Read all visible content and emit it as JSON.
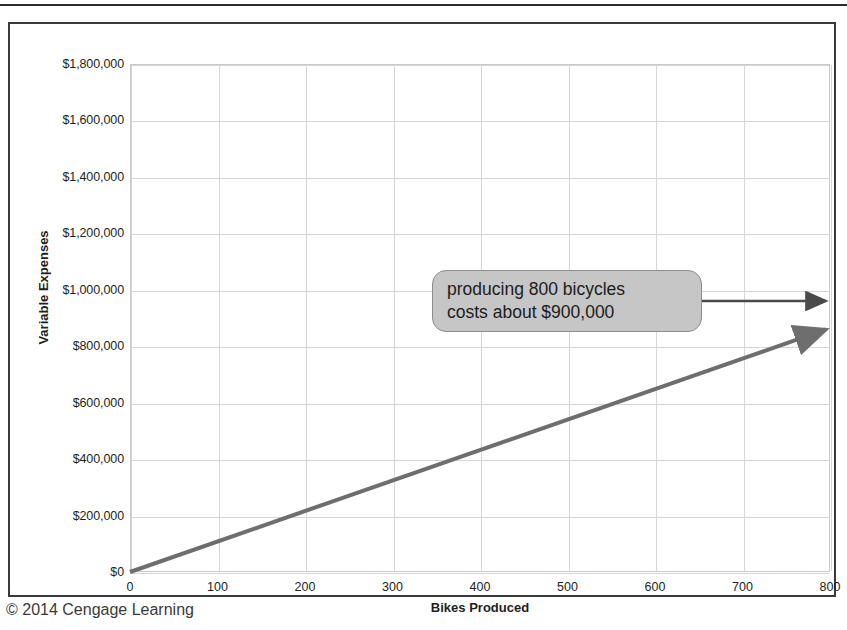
{
  "figure": {
    "credit": "© 2014 Cengage Learning"
  },
  "callout": {
    "line1": "producing 800 bicycles",
    "line2": "costs about $900,000",
    "fill_color": "#c6c6c6",
    "border_color": "#8d8d8d"
  },
  "chart_data": {
    "type": "line",
    "title": "",
    "subtitle": "",
    "xlabel": "Bikes Produced",
    "ylabel": "Variable Expenses",
    "xlim": [
      0,
      800
    ],
    "ylim": [
      0,
      1800000
    ],
    "grid": true,
    "legend": "none",
    "line_color": "#6e6e6e",
    "x_ticks": [
      0,
      100,
      200,
      300,
      400,
      500,
      600,
      700,
      800
    ],
    "x_tick_labels": [
      "0",
      "100",
      "200",
      "300",
      "400",
      "500",
      "600",
      "700",
      "800"
    ],
    "y_ticks": [
      0,
      200000,
      400000,
      600000,
      800000,
      1000000,
      1200000,
      1400000,
      1600000,
      1800000
    ],
    "y_tick_labels": [
      "$0",
      "$200,000",
      "$400,000",
      "$600,000",
      "$800,000",
      "$1,000,000",
      "$1,200,000",
      "$1,400,000",
      "$1,600,000",
      "$1,800,000"
    ],
    "series": [
      {
        "name": "Variable Expenses",
        "x": [
          0,
          800
        ],
        "values": [
          0,
          870000
        ]
      }
    ],
    "annotations": [
      {
        "text": "producing 800 bicycles costs about $900,000",
        "points_to_x": 800,
        "points_to_y": 900000
      }
    ]
  }
}
